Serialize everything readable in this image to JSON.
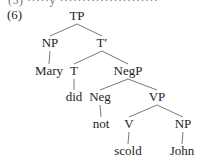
{
  "example": {
    "number": "(6)",
    "cut_text": "(5)   ·····y ······················"
  },
  "tree": {
    "nodes": [
      {
        "id": "TP",
        "label": "TP",
        "x": 77,
        "y": 20
      },
      {
        "id": "NP1",
        "label": "NP",
        "x": 50,
        "y": 47
      },
      {
        "id": "Tbar",
        "label": "T′",
        "x": 102,
        "y": 47
      },
      {
        "id": "Mary",
        "label": "Mary",
        "x": 49,
        "y": 75
      },
      {
        "id": "T",
        "label": "T",
        "x": 74,
        "y": 75
      },
      {
        "id": "NegP",
        "label": "NegP",
        "x": 128,
        "y": 75
      },
      {
        "id": "did",
        "label": "did",
        "x": 74,
        "y": 101
      },
      {
        "id": "Neg",
        "label": "Neg",
        "x": 100,
        "y": 101
      },
      {
        "id": "VP",
        "label": "VP",
        "x": 157,
        "y": 101
      },
      {
        "id": "not",
        "label": "not",
        "x": 101,
        "y": 128
      },
      {
        "id": "V",
        "label": "V",
        "x": 129,
        "y": 128
      },
      {
        "id": "NP2",
        "label": "NP",
        "x": 183,
        "y": 128
      },
      {
        "id": "scold",
        "label": "scold",
        "x": 128,
        "y": 155
      },
      {
        "id": "John",
        "label": "John",
        "x": 182,
        "y": 155
      }
    ],
    "edges": [
      [
        "TP",
        "NP1"
      ],
      [
        "TP",
        "Tbar"
      ],
      [
        "NP1",
        "Mary"
      ],
      [
        "Tbar",
        "T"
      ],
      [
        "Tbar",
        "NegP"
      ],
      [
        "T",
        "did"
      ],
      [
        "NegP",
        "Neg"
      ],
      [
        "NegP",
        "VP"
      ],
      [
        "Neg",
        "not"
      ],
      [
        "VP",
        "V"
      ],
      [
        "VP",
        "NP2"
      ],
      [
        "V",
        "scold"
      ],
      [
        "NP2",
        "John"
      ]
    ]
  }
}
